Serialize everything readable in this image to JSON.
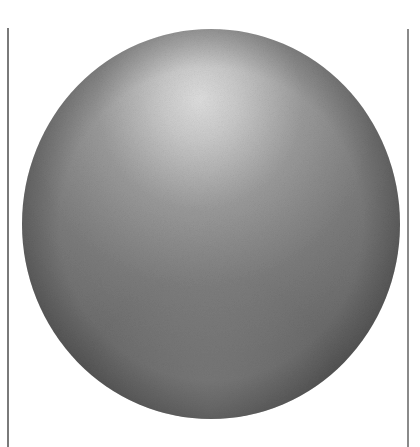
{
  "image": {
    "subject": "shaded gray sphere",
    "description": "Grayscale illustration of a sphere lit from the upper center, with a soft highlight near the top and darker shading toward the bottom, framed by two thin vertical lines.",
    "colors": {
      "background": "#ffffff",
      "highlight": "#dcdcdc",
      "midtone": "#8e8e8e",
      "shadow": "#5a5a5a",
      "frame_line": "#7a7a7a"
    }
  }
}
